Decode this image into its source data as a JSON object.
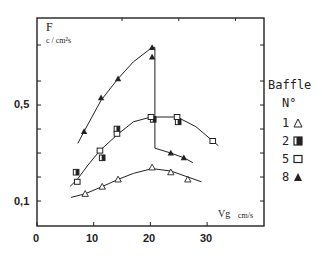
{
  "chart_data": {
    "type": "scatter",
    "title": "",
    "ylabel": "F",
    "ylabel_unit": "c / cm²s",
    "xlabel": "Vg",
    "xlabel_unit": "cm/s",
    "xlim": [
      0,
      40
    ],
    "ylim": [
      0,
      0.86
    ],
    "x_ticks": [
      0,
      10,
      20,
      30
    ],
    "x_tick_labels": [
      "0",
      "10",
      "20",
      "30"
    ],
    "y_tick_labels": [
      "0,5",
      "0,1"
    ],
    "y_ticks_labeled": [
      0.5,
      0.1
    ],
    "grid": false,
    "legend": {
      "title": "Baffle",
      "subtitle": "N°",
      "position": "right",
      "entries": [
        {
          "label": "1",
          "marker": "open-triangle"
        },
        {
          "label": "2",
          "marker": "half-filled-square"
        },
        {
          "label": "5",
          "marker": "open-square"
        },
        {
          "label": "8",
          "marker": "filled-triangle"
        }
      ]
    },
    "series": [
      {
        "name": "1",
        "marker": "open-triangle",
        "x": [
          8.5,
          11.5,
          14.3,
          20.3,
          23.6,
          26.6
        ],
        "y": [
          0.13,
          0.16,
          0.19,
          0.24,
          0.22,
          0.19
        ]
      },
      {
        "name": "2",
        "marker": "half-filled-square",
        "x": [
          6.9,
          11.5,
          14.1,
          20.5,
          24.9
        ],
        "y": [
          0.22,
          0.28,
          0.4,
          0.44,
          0.43
        ]
      },
      {
        "name": "5",
        "marker": "open-square",
        "x": [
          7.1,
          11.1,
          14.1,
          20.1,
          24.7,
          31.0
        ],
        "y": [
          0.18,
          0.31,
          0.38,
          0.45,
          0.45,
          0.35
        ]
      },
      {
        "name": "8",
        "marker": "filled-triangle",
        "x": [
          8.3,
          11.3,
          14.3,
          20.3,
          20.3,
          23.6,
          25.9
        ],
        "y": [
          0.39,
          0.53,
          0.61,
          0.74,
          0.7,
          0.3,
          0.28
        ]
      }
    ],
    "annotations": [
      "Vertical drop line at Vg ≈ 20.5 cm/s from F ≈ 0.74 to F ≈ 0.32 (baffle 8 transition)"
    ]
  },
  "axis": {
    "y_title": "F",
    "y_unit": "c / cm²s",
    "x_title": "Vg",
    "x_unit": "cm/s",
    "y_label_05": "0,5",
    "y_label_01": "0,1",
    "x_labels": [
      "0",
      "10",
      "20",
      "30"
    ]
  },
  "legend": {
    "title": "Baffle",
    "subtitle": "N°",
    "items": [
      {
        "label": "1",
        "marker": "open-triangle"
      },
      {
        "label": "2",
        "marker": "half-filled-square"
      },
      {
        "label": "5",
        "marker": "open-square"
      },
      {
        "label": "8",
        "marker": "filled-triangle"
      }
    ]
  }
}
